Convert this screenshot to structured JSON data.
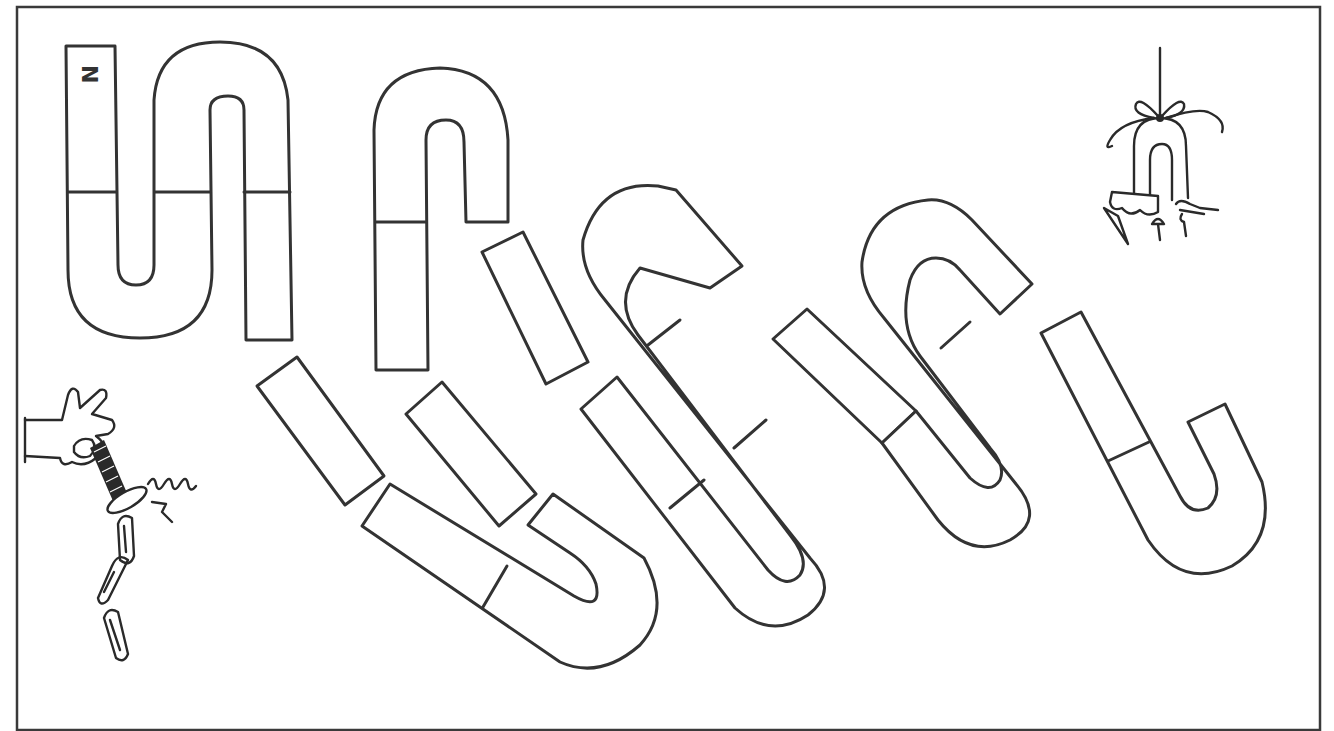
{
  "worksheet": {
    "pole_label": "N",
    "colors": {
      "line": "#333333",
      "background": "#ffffff"
    },
    "pieces": [
      {
        "id": "s-magnet-complete",
        "description": "S-shaped double magnet with N label"
      },
      {
        "id": "hook-magnet",
        "description": "Hook-shaped magnet piece"
      },
      {
        "id": "bar-1",
        "description": "Loose bar segment"
      },
      {
        "id": "bar-2",
        "description": "Loose bar segment"
      },
      {
        "id": "bar-3",
        "description": "Loose bar segment"
      },
      {
        "id": "bar-4",
        "description": "Loose bar segment"
      },
      {
        "id": "u-magnet-bottom",
        "description": "U-shaped magnet piece"
      },
      {
        "id": "s-magnet-diagonal-1",
        "description": "Diagonal S-shaped magnet"
      },
      {
        "id": "s-magnet-diagonal-2",
        "description": "Diagonal S-shaped magnet"
      },
      {
        "id": "j-magnet-right",
        "description": "J-shaped magnet piece"
      }
    ],
    "illustrations": [
      {
        "id": "hand-with-magnet-and-paperclips",
        "description": "Hand holding a bar magnet with a spring and chain of paper clips"
      },
      {
        "id": "hanging-horseshoe-magnet",
        "description": "Horseshoe magnet hanging by a string holding tacks and nails"
      }
    ]
  }
}
